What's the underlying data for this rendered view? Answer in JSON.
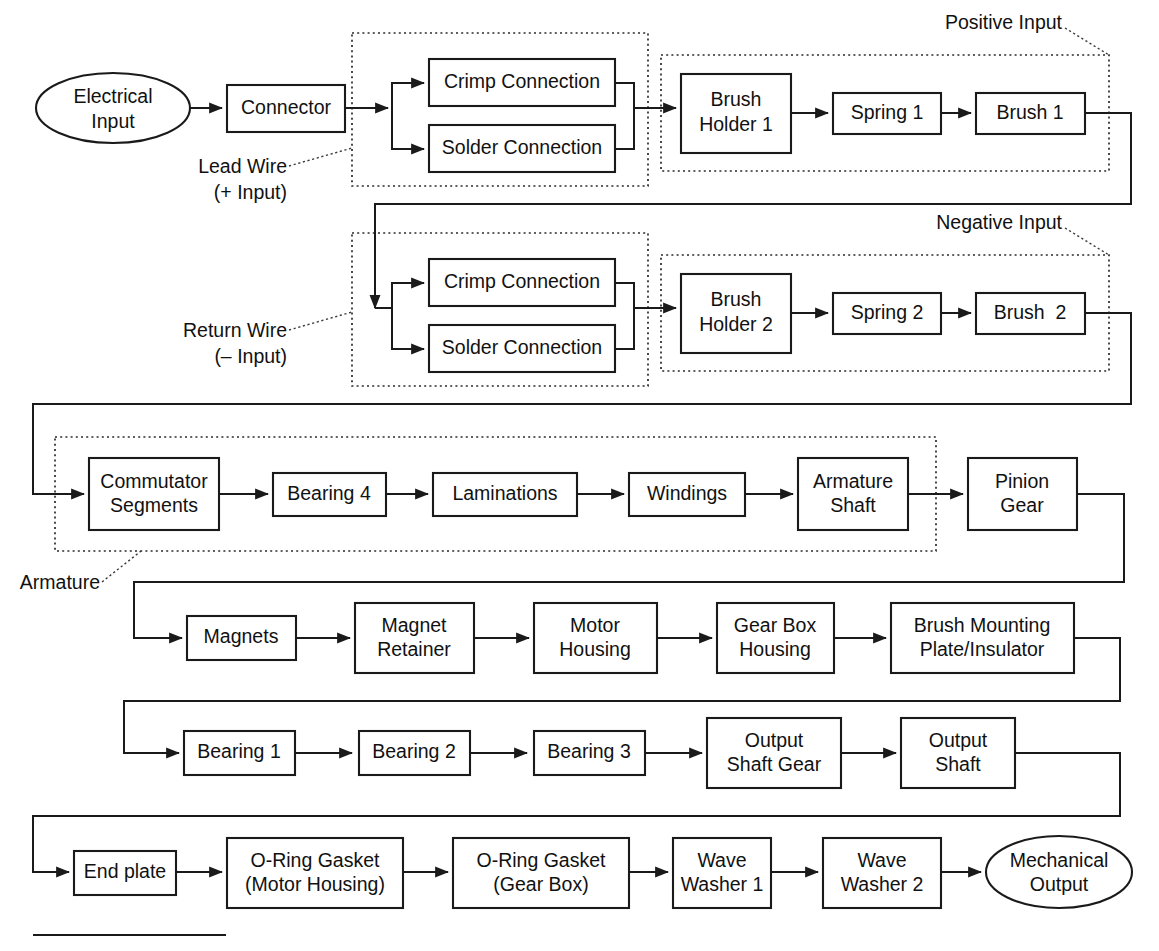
{
  "diagram": {
    "type": "block-flow-diagram",
    "terminals": {
      "input": "Electrical\nInput",
      "input_line1": "Electrical",
      "input_line2": "Input",
      "output_line1": "Mechanical",
      "output_line2": "Output"
    },
    "group_labels": {
      "lead_wire_line1": "Lead Wire",
      "lead_wire_line2": "(+ Input)",
      "return_wire_line1": "Return Wire",
      "return_wire_line2": "(– Input)",
      "positive_input": "Positive Input",
      "negative_input": "Negative Input",
      "armature": "Armature"
    },
    "rows": [
      {
        "id": "row-1",
        "nodes": [
          {
            "id": "connector",
            "label": "Connector"
          },
          {
            "id": "crimp-connection-1",
            "label": "Crimp Connection"
          },
          {
            "id": "solder-connection-1",
            "label": "Solder Connection"
          },
          {
            "id": "brush-holder-1",
            "line1": "Brush",
            "line2": "Holder 1"
          },
          {
            "id": "spring-1",
            "label": "Spring 1"
          },
          {
            "id": "brush-1",
            "label": "Brush 1"
          }
        ]
      },
      {
        "id": "row-2",
        "nodes": [
          {
            "id": "crimp-connection-2",
            "label": "Crimp Connection"
          },
          {
            "id": "solder-connection-2",
            "label": "Solder Connection"
          },
          {
            "id": "brush-holder-2",
            "line1": "Brush",
            "line2": "Holder 2"
          },
          {
            "id": "spring-2",
            "label": "Spring 2"
          },
          {
            "id": "brush-2",
            "label": "Brush  2"
          }
        ]
      },
      {
        "id": "row-3",
        "nodes": [
          {
            "id": "commutator-segments",
            "line1": "Commutator",
            "line2": "Segments"
          },
          {
            "id": "bearing-4",
            "label": "Bearing 4"
          },
          {
            "id": "laminations",
            "label": "Laminations"
          },
          {
            "id": "windings",
            "label": "Windings"
          },
          {
            "id": "armature-shaft",
            "line1": "Armature",
            "line2": "Shaft"
          },
          {
            "id": "pinion-gear",
            "line1": "Pinion",
            "line2": "Gear"
          }
        ]
      },
      {
        "id": "row-4",
        "nodes": [
          {
            "id": "magnets",
            "label": "Magnets"
          },
          {
            "id": "magnet-retainer",
            "line1": "Magnet",
            "line2": "Retainer"
          },
          {
            "id": "motor-housing",
            "line1": "Motor",
            "line2": "Housing"
          },
          {
            "id": "gear-box-housing",
            "line1": "Gear Box",
            "line2": "Housing"
          },
          {
            "id": "brush-mounting-plate",
            "line1": "Brush Mounting",
            "line2": "Plate/Insulator"
          }
        ]
      },
      {
        "id": "row-5",
        "nodes": [
          {
            "id": "bearing-1",
            "label": "Bearing 1"
          },
          {
            "id": "bearing-2",
            "label": "Bearing 2"
          },
          {
            "id": "bearing-3",
            "label": "Bearing 3"
          },
          {
            "id": "output-shaft-gear",
            "line1": "Output",
            "line2": "Shaft Gear"
          },
          {
            "id": "output-shaft",
            "line1": "Output",
            "line2": "Shaft"
          }
        ]
      },
      {
        "id": "row-6",
        "nodes": [
          {
            "id": "end-plate",
            "label": "End plate"
          },
          {
            "id": "o-ring-gasket-motor",
            "line1": "O-Ring Gasket",
            "line2": "(Motor Housing)"
          },
          {
            "id": "o-ring-gasket-gearbox",
            "line1": "O-Ring Gasket",
            "line2": "(Gear Box)"
          },
          {
            "id": "wave-washer-1",
            "line1": "Wave",
            "line2": "Washer 1"
          },
          {
            "id": "wave-washer-2",
            "line1": "Wave",
            "line2": "Washer 2"
          }
        ]
      }
    ],
    "colors": {
      "stroke": "#1a1a1a",
      "dashed_stroke": "#2b2b2b",
      "background": "#ffffff",
      "text": "#111111"
    }
  }
}
